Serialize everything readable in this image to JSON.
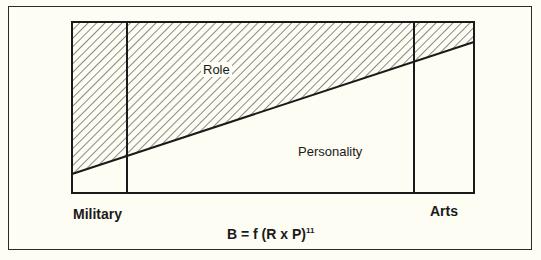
{
  "diagram": {
    "regions": {
      "upper_label": "Role",
      "lower_label": "Personality"
    },
    "axis": {
      "left_label": "Military",
      "right_label": "Arts"
    },
    "formula": {
      "main": "B = f (R x P)",
      "superscript": "11"
    },
    "colors": {
      "background": "#fdfdf3",
      "line": "#1a1a1a"
    }
  }
}
